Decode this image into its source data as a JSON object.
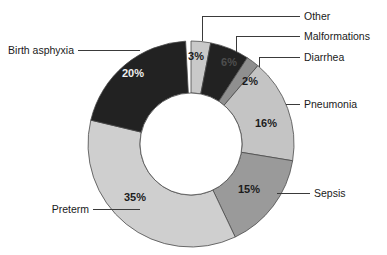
{
  "chart_data": {
    "type": "pie",
    "variant": "donut",
    "title": "",
    "subtitle": "",
    "xlabel": "",
    "ylabel": "",
    "legend_position": "callout-labels",
    "grid": false,
    "value_unit": "%",
    "categories": [
      "Other",
      "Malformations",
      "Diarrhea",
      "Pneumonia",
      "Sepsis",
      "Preterm",
      "Birth asphyxia"
    ],
    "values": [
      3,
      6,
      2,
      16,
      15,
      35,
      20
    ],
    "labels": [
      "3%",
      "6%",
      "2%",
      "16%",
      "15%",
      "35%",
      "20%"
    ],
    "colors": [
      "#c9c9c9",
      "#222222",
      "#8f8f8f",
      "#c4c4c4",
      "#9a9a9a",
      "#cfcfcf",
      "#222222"
    ],
    "slices": [
      {
        "name": "Other",
        "value": 3,
        "label": "3%",
        "color": "#c9c9c9",
        "text_tone": "dark"
      },
      {
        "name": "Malformations",
        "value": 6,
        "label": "6%",
        "color": "#222222",
        "text_tone": "dim"
      },
      {
        "name": "Diarrhea",
        "value": 2,
        "label": "2%",
        "color": "#8f8f8f",
        "text_tone": "dark"
      },
      {
        "name": "Pneumonia",
        "value": 16,
        "label": "16%",
        "color": "#c4c4c4",
        "text_tone": "dark"
      },
      {
        "name": "Sepsis",
        "value": 15,
        "label": "15%",
        "color": "#9a9a9a",
        "text_tone": "dark"
      },
      {
        "name": "Preterm",
        "value": 35,
        "label": "35%",
        "color": "#cfcfcf",
        "text_tone": "dark"
      },
      {
        "name": "Birth asphyxia",
        "value": 20,
        "label": "20%",
        "color": "#222222",
        "text_tone": "light"
      }
    ]
  },
  "callouts": {
    "other": "Other",
    "malformations": "Malformations",
    "diarrhea": "Diarrhea",
    "pneumonia": "Pneumonia",
    "sepsis": "Sepsis",
    "preterm": "Preterm",
    "birth_asphyxia": "Birth asphyxia"
  },
  "slice_labels": {
    "other": "3%",
    "malformations": "6%",
    "diarrhea": "2%",
    "pneumonia": "16%",
    "sepsis": "15%",
    "preterm": "35%",
    "birth_asphyxia": "20%"
  }
}
